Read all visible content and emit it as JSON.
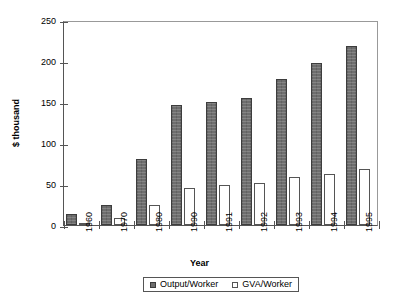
{
  "chart_data": {
    "type": "bar",
    "title": "",
    "xlabel": "Year",
    "ylabel": "$ thousand",
    "categories": [
      "1960",
      "1970",
      "1980",
      "1990",
      "1991",
      "1992",
      "1993",
      "1994",
      "1995"
    ],
    "series": [
      {
        "name": "Output/Worker",
        "values": [
          13,
          24,
          80,
          146,
          150,
          155,
          178,
          198,
          218
        ]
      },
      {
        "name": "GVA/Worker",
        "values": [
          3,
          8,
          24,
          45,
          49,
          51,
          58,
          62,
          68
        ]
      }
    ],
    "ylim": [
      0,
      250
    ],
    "yticks": [
      0,
      50,
      100,
      150,
      200,
      250
    ],
    "grid": false,
    "legend_position": "bottom",
    "colors": {
      "series0": "#6e6e6e",
      "series1": "#ffffff",
      "axis": "#555555"
    }
  },
  "legend": {
    "items": [
      {
        "label": "Output/Worker"
      },
      {
        "label": "GVA/Worker"
      }
    ]
  }
}
